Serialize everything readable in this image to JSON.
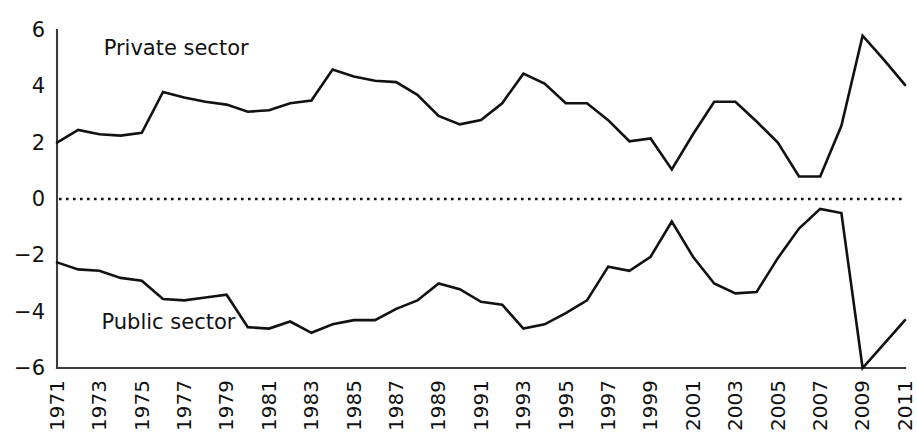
{
  "chart_data": {
    "type": "line",
    "title": "",
    "subtitle": "",
    "xlabel": "",
    "ylabel": "",
    "grid": false,
    "legend_position": "inline-annotation",
    "zero_reference_line": true,
    "xlim": [
      1971,
      2011
    ],
    "ylim": [
      -6,
      6
    ],
    "ytick_labels": [
      "6",
      "4",
      "2",
      "0",
      "−2",
      "−4",
      "−6"
    ],
    "ytick_values": [
      6,
      4,
      2,
      0,
      -2,
      -4,
      -6
    ],
    "xtick_labels": [
      "1971",
      "1973",
      "1975",
      "1977",
      "1979",
      "1981",
      "1983",
      "1985",
      "1987",
      "1989",
      "1991",
      "1993",
      "1995",
      "1997",
      "1999",
      "2001",
      "2003",
      "2005",
      "2007",
      "2009",
      "2011"
    ],
    "xtick_values": [
      1971,
      1973,
      1975,
      1977,
      1979,
      1981,
      1983,
      1985,
      1987,
      1989,
      1991,
      1993,
      1995,
      1997,
      1999,
      2001,
      2003,
      2005,
      2007,
      2009,
      2011
    ],
    "x": [
      1971,
      1972,
      1973,
      1974,
      1975,
      1976,
      1977,
      1978,
      1979,
      1980,
      1981,
      1982,
      1983,
      1984,
      1985,
      1986,
      1987,
      1988,
      1989,
      1990,
      1991,
      1992,
      1993,
      1994,
      1995,
      1996,
      1997,
      1998,
      1999,
      2000,
      2001,
      2002,
      2003,
      2004,
      2005,
      2006,
      2007,
      2008,
      2009,
      2010,
      2011
    ],
    "series": [
      {
        "name": "Private sector",
        "annotation": "Private sector",
        "annotation_x": 1973.2,
        "annotation_y": 5.1,
        "values": [
          2.0,
          2.45,
          2.3,
          2.25,
          2.35,
          3.8,
          3.6,
          3.45,
          3.35,
          3.1,
          3.15,
          3.4,
          3.5,
          4.6,
          4.35,
          4.2,
          4.15,
          3.7,
          2.95,
          2.65,
          2.8,
          3.4,
          4.45,
          4.1,
          3.4,
          3.4,
          2.8,
          2.05,
          2.15,
          1.05,
          2.3,
          3.45,
          3.45,
          2.75,
          2.0,
          0.8,
          0.8,
          2.6,
          5.8,
          4.95,
          4.05
        ]
      },
      {
        "name": "Public sector",
        "annotation": "Public sector",
        "annotation_x": 1973.1,
        "annotation_y": -4.6,
        "values": [
          -2.25,
          -2.5,
          -2.55,
          -2.8,
          -2.9,
          -3.55,
          -3.6,
          -3.5,
          -3.4,
          -4.55,
          -4.6,
          -4.35,
          -4.75,
          -4.45,
          -4.3,
          -4.3,
          -3.9,
          -3.6,
          -3.0,
          -3.2,
          -3.65,
          -3.75,
          -4.6,
          -4.45,
          -4.05,
          -3.6,
          -2.4,
          -2.55,
          -2.05,
          -0.8,
          -2.05,
          -3.0,
          -3.35,
          -3.3,
          -2.1,
          -1.05,
          -0.35,
          -0.5,
          -6.0,
          -5.15,
          -4.3
        ]
      }
    ]
  }
}
